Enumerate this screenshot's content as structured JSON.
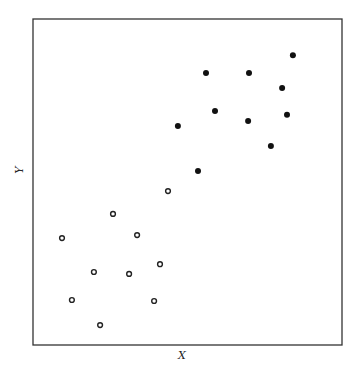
{
  "chart_data": {
    "type": "scatter",
    "title": "",
    "xlabel": "X",
    "ylabel": "Y",
    "xlim": [
      0,
      10
    ],
    "ylim": [
      0,
      10
    ],
    "grid": false,
    "legend": null,
    "series": [
      {
        "name": "filled",
        "marker": "filled-circle",
        "color": "#111111",
        "points": [
          [
            8.41,
            8.89
          ],
          [
            5.6,
            8.34
          ],
          [
            6.99,
            8.34
          ],
          [
            8.06,
            7.88
          ],
          [
            5.89,
            7.18
          ],
          [
            8.22,
            7.06
          ],
          [
            6.96,
            6.87
          ],
          [
            4.69,
            6.72
          ],
          [
            7.7,
            6.1
          ],
          [
            5.34,
            5.34
          ]
        ]
      },
      {
        "name": "open",
        "marker": "open-circle",
        "color": "#222222",
        "points": [
          [
            4.37,
            4.72
          ],
          [
            2.59,
            4.02
          ],
          [
            3.37,
            3.37
          ],
          [
            0.94,
            3.28
          ],
          [
            4.11,
            2.48
          ],
          [
            1.97,
            2.24
          ],
          [
            3.11,
            2.18
          ],
          [
            1.26,
            1.38
          ],
          [
            3.92,
            1.35
          ],
          [
            2.17,
            0.61
          ]
        ]
      }
    ]
  }
}
